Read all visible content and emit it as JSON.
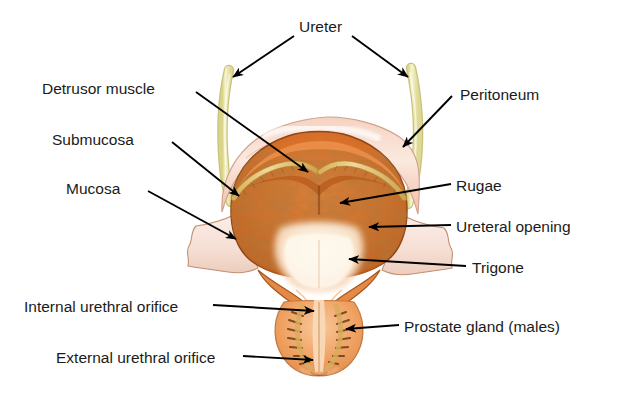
{
  "figure": {
    "background_color": "#ffffff",
    "width": 638,
    "height": 393
  },
  "palette": {
    "label_text": "#1b1b1b",
    "leader_line": "#000000",
    "ureter_tube": "#eeeab4",
    "ureter_tube_edge": "#c9c27a",
    "peritoneum_serosa": "#f3c9b6",
    "peritoneum_highlight": "#fdeee6",
    "detrusor_muscle": "#d8702a",
    "detrusor_dark": "#8a4516",
    "submucosa_band": "#e8c277",
    "mucosa_flap": "#f7e3dc",
    "mucosa_edge": "#c98a63",
    "rugae_mottle": "#7d3f15",
    "trigone_pale": "#fdf3e2",
    "urethra_wall": "#e58a46",
    "prostate_tissue": "#f0a263",
    "prostate_gland_dark": "#6e4018",
    "outline": "#5d3317"
  },
  "labels": {
    "ureter": {
      "text": "Ureter",
      "side": "top",
      "x": 299,
      "y": 18,
      "arrows": 2
    },
    "detrusor_muscle": {
      "text": "Detrusor muscle",
      "side": "left",
      "x": 42,
      "y": 80
    },
    "submucosa": {
      "text": "Submucosa",
      "side": "left",
      "x": 52,
      "y": 131
    },
    "mucosa": {
      "text": "Mucosa",
      "side": "left",
      "x": 66,
      "y": 180
    },
    "internal_urethral_orifice": {
      "text": "Internal urethral orifice",
      "side": "left",
      "x": 24,
      "y": 298
    },
    "external_urethral_orifice": {
      "text": "External urethral orifice",
      "side": "left",
      "x": 56,
      "y": 349
    },
    "peritoneum": {
      "text": "Peritoneum",
      "side": "right",
      "x": 460,
      "y": 86
    },
    "rugae": {
      "text": "Rugae",
      "side": "right",
      "x": 456,
      "y": 177
    },
    "ureteral_opening": {
      "text": "Ureteral opening",
      "side": "right",
      "x": 456,
      "y": 218
    },
    "trigone": {
      "text": "Trigone",
      "side": "right",
      "x": 472,
      "y": 259
    },
    "prostate_gland": {
      "text": "Prostate gland (males)",
      "side": "right",
      "x": 404,
      "y": 318
    }
  },
  "structures": [
    {
      "name": "left-ureter",
      "label_ref": "ureter"
    },
    {
      "name": "right-ureter",
      "label_ref": "ureter"
    },
    {
      "name": "peritoneum-serosa",
      "label_ref": "peritoneum"
    },
    {
      "name": "detrusor-muscle-layer",
      "label_ref": "detrusor_muscle"
    },
    {
      "name": "submucosa-layer",
      "label_ref": "submucosa"
    },
    {
      "name": "mucosa-layer",
      "label_ref": "mucosa"
    },
    {
      "name": "rugae-folds",
      "label_ref": "rugae"
    },
    {
      "name": "ureteral-opening",
      "label_ref": "ureteral_opening"
    },
    {
      "name": "trigone-region",
      "label_ref": "trigone"
    },
    {
      "name": "internal-urethral-orifice",
      "label_ref": "internal_urethral_orifice"
    },
    {
      "name": "prostate-gland",
      "label_ref": "prostate_gland"
    },
    {
      "name": "external-urethral-orifice",
      "label_ref": "external_urethral_orifice"
    }
  ]
}
